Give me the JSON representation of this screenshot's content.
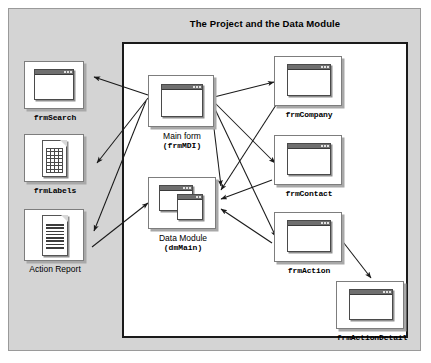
{
  "figure": {
    "title": "The Project and the Data Module",
    "outer_background": "#d4d4d4",
    "inner_background": "#ffffff",
    "border_color": "#1a1a1a"
  },
  "nodes": [
    {
      "id": "frmSearch",
      "label": "frmSearch",
      "label_style": "mono",
      "icon": "window-form-icon",
      "region": "outside"
    },
    {
      "id": "frmLabels",
      "label": "frmLabels",
      "label_style": "mono",
      "icon": "grid-report-icon",
      "region": "outside"
    },
    {
      "id": "ActionReport",
      "label": "Action Report",
      "label_style": "sans",
      "icon": "text-report-icon",
      "region": "outside"
    },
    {
      "id": "frmMDI",
      "label": "Main form",
      "label2": "(frmMDI)",
      "label_style": "sans",
      "icon": "window-form-icon",
      "region": "inside"
    },
    {
      "id": "dmMain",
      "label": "Data Module",
      "label2": "(dmMain)",
      "label_style": "sans",
      "icon": "data-module-icon",
      "region": "inside"
    },
    {
      "id": "frmCompany",
      "label": "frmCompany",
      "label_style": "mono",
      "icon": "window-form-icon",
      "region": "inside"
    },
    {
      "id": "frmContact",
      "label": "frmContact",
      "label_style": "mono",
      "icon": "window-form-icon",
      "region": "inside"
    },
    {
      "id": "frmAction",
      "label": "frmAction",
      "label_style": "mono",
      "icon": "window-form-icon",
      "region": "inside"
    },
    {
      "id": "frmActionDetail",
      "label": "frmActionDetail",
      "label_style": "mono",
      "icon": "window-form-icon",
      "region": "inside"
    }
  ],
  "connections": [
    {
      "from": "frmMDI",
      "to": "frmSearch"
    },
    {
      "from": "frmMDI",
      "to": "frmLabels"
    },
    {
      "from": "frmMDI",
      "to": "ActionReport"
    },
    {
      "from": "frmMDI",
      "to": "frmCompany"
    },
    {
      "from": "frmMDI",
      "to": "frmContact"
    },
    {
      "from": "frmMDI",
      "to": "frmAction"
    },
    {
      "from": "frmMDI",
      "to": "dmMain"
    },
    {
      "from": "ActionReport",
      "to": "dmMain"
    },
    {
      "from": "frmCompany",
      "to": "dmMain"
    },
    {
      "from": "frmContact",
      "to": "dmMain"
    },
    {
      "from": "frmAction",
      "to": "dmMain"
    },
    {
      "from": "frmAction",
      "to": "frmActionDetail"
    }
  ]
}
